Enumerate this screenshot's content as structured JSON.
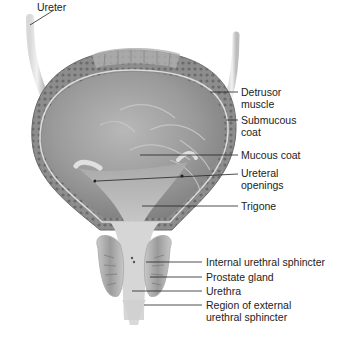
{
  "figure": {
    "labels": [
      {
        "id": "ureter",
        "lines": [
          "Ureter"
        ]
      },
      {
        "id": "detrusor",
        "lines": [
          "Detrusor",
          "muscle"
        ]
      },
      {
        "id": "submucous",
        "lines": [
          "Submucous",
          "coat"
        ]
      },
      {
        "id": "mucous",
        "lines": [
          "Mucous coat"
        ]
      },
      {
        "id": "ureteral-openings",
        "lines": [
          "Ureteral",
          "openings"
        ]
      },
      {
        "id": "trigone",
        "lines": [
          "Trigone"
        ]
      },
      {
        "id": "internal-sphincter",
        "lines": [
          "Internal urethral sphincter"
        ]
      },
      {
        "id": "prostate",
        "lines": [
          "Prostate gland"
        ]
      },
      {
        "id": "urethra",
        "lines": [
          "Urethra"
        ]
      },
      {
        "id": "external-sphincter",
        "lines": [
          "Region of external",
          "urethral sphincter"
        ]
      }
    ]
  },
  "colors": {
    "background": "#ffffff",
    "leader_line": "#222222",
    "wall_outer": "#8a8a8a",
    "wall_inner": "#b5b5b5",
    "lumen": "#9c9c9c",
    "rule": "#555555"
  }
}
